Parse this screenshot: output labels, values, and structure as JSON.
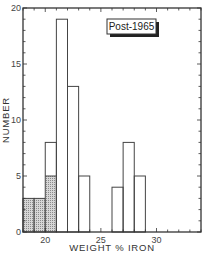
{
  "chart_data": {
    "type": "bar",
    "subtype": "histogram",
    "title": "",
    "annotation": "Post-1965",
    "xlabel": "WEIGHT % IRON",
    "ylabel": "NUMBER",
    "xlim": [
      18,
      34
    ],
    "ylim": [
      0,
      20
    ],
    "xticks": [
      20,
      25,
      30
    ],
    "yticks": [
      0,
      5,
      10,
      15,
      20
    ],
    "bin_width": 1,
    "grid": false,
    "legend": null,
    "bins": [
      {
        "x0": 18,
        "x1": 19,
        "value": 3,
        "hatched": 3
      },
      {
        "x0": 19,
        "x1": 20,
        "value": 3,
        "hatched": 3
      },
      {
        "x0": 20,
        "x1": 21,
        "value": 8,
        "hatched": 5
      },
      {
        "x0": 21,
        "x1": 22,
        "value": 19,
        "hatched": 0
      },
      {
        "x0": 22,
        "x1": 23,
        "value": 13,
        "hatched": 0
      },
      {
        "x0": 23,
        "x1": 24,
        "value": 5,
        "hatched": 0
      },
      {
        "x0": 26,
        "x1": 27,
        "value": 4,
        "hatched": 0
      },
      {
        "x0": 27,
        "x1": 28,
        "value": 8,
        "hatched": 0
      },
      {
        "x0": 28,
        "x1": 29,
        "value": 5,
        "hatched": 0
      }
    ],
    "series": [
      {
        "name": "Total",
        "categories": [
          "18-19",
          "19-20",
          "20-21",
          "21-22",
          "22-23",
          "23-24",
          "26-27",
          "27-28",
          "28-29"
        ],
        "values": [
          3,
          3,
          8,
          19,
          13,
          5,
          4,
          8,
          5
        ]
      },
      {
        "name": "Hatched subset",
        "categories": [
          "18-19",
          "19-20",
          "20-21"
        ],
        "values": [
          3,
          3,
          5
        ]
      }
    ]
  },
  "colors": {
    "axis": "#333333",
    "bar_stroke": "#444444",
    "bar_fill": "#ffffff",
    "hatch": "#9a9a9a"
  }
}
